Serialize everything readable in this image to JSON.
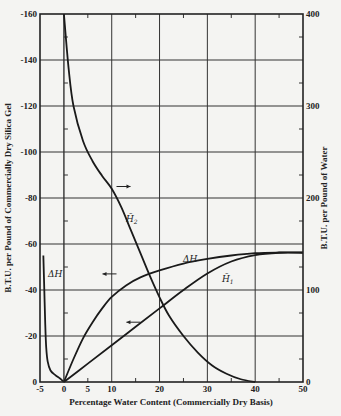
{
  "chart_data": {
    "type": "line",
    "title": "",
    "xlabel": "Percentage Water Content (Commercially Dry Basis)",
    "ylabel_left": "B.T.U. per Pound of Commercially Dry Silica Gel",
    "ylabel_right": "B.T.U. per Pound of Water",
    "xlim": [
      -5,
      50
    ],
    "ylim_left": [
      0,
      -160
    ],
    "ylim_right": [
      0,
      400
    ],
    "grid": true,
    "x_ticks": [
      "-5",
      "0",
      "5",
      "10",
      "20",
      "30",
      "40",
      "50"
    ],
    "y_left_ticks": [
      "0",
      "-20",
      "-40",
      "-60",
      "-80",
      "-100",
      "-120",
      "-140",
      "-160"
    ],
    "y_right_ticks": [
      "0",
      "100",
      "200",
      "300",
      "400"
    ],
    "series": [
      {
        "name": "H̄2",
        "axis": "right",
        "label": "H̄2",
        "points": [
          [
            0,
            400
          ],
          [
            1,
            340
          ],
          [
            2,
            300
          ],
          [
            4,
            262
          ],
          [
            6,
            240
          ],
          [
            8,
            224
          ],
          [
            10,
            210
          ],
          [
            12,
            190
          ],
          [
            14,
            165
          ],
          [
            16,
            140
          ],
          [
            18,
            115
          ],
          [
            20,
            92
          ],
          [
            22,
            72
          ],
          [
            25,
            50
          ],
          [
            28,
            32
          ],
          [
            31,
            18
          ],
          [
            34,
            9
          ],
          [
            37,
            3
          ],
          [
            40,
            0
          ]
        ]
      },
      {
        "name": "ΔH",
        "axis": "left",
        "label": "ΔH",
        "points": [
          [
            0,
            0
          ],
          [
            2,
            -10
          ],
          [
            4,
            -19
          ],
          [
            6,
            -26
          ],
          [
            8,
            -32
          ],
          [
            10,
            -37
          ],
          [
            13,
            -42
          ],
          [
            16,
            -45.5
          ],
          [
            20,
            -48.5
          ],
          [
            25,
            -51.5
          ],
          [
            30,
            -53.5
          ],
          [
            35,
            -55
          ],
          [
            40,
            -56
          ],
          [
            45,
            -56.3
          ],
          [
            50,
            -56.3
          ]
        ]
      },
      {
        "name": "ΔH (dehydration branch)",
        "axis": "left",
        "label": "ΔH",
        "points": [
          [
            -4.3,
            -55
          ],
          [
            -4.1,
            -40
          ],
          [
            -3.9,
            -25
          ],
          [
            -3.7,
            -15
          ],
          [
            -3.4,
            -9
          ],
          [
            -2.8,
            -5
          ],
          [
            -1.8,
            -3
          ],
          [
            -0.8,
            -1.5
          ],
          [
            0,
            0
          ]
        ]
      },
      {
        "name": "H̄1",
        "axis": "right",
        "label": "H̄1",
        "points": [
          [
            0,
            0
          ],
          [
            5,
            20
          ],
          [
            10,
            40
          ],
          [
            15,
            60
          ],
          [
            20,
            80
          ],
          [
            25,
            100
          ],
          [
            30,
            118
          ],
          [
            35,
            131
          ],
          [
            40,
            138
          ],
          [
            45,
            140.5
          ],
          [
            50,
            140.5
          ]
        ]
      }
    ],
    "annotations": [
      {
        "type": "arrow",
        "direction": "right",
        "near": "H̄2",
        "at": [
          11,
          -85
        ]
      },
      {
        "type": "arrow",
        "direction": "left",
        "near": "ΔH",
        "at": [
          11,
          -47
        ]
      },
      {
        "type": "arrow",
        "direction": "left",
        "near": "H̄1",
        "at": [
          16,
          -26
        ]
      }
    ]
  },
  "labels": {
    "xlabel": "Percentage Water Content (Commercially Dry Basis)",
    "ylabel_left": "B.T.U. per Pound of Commercially Dry Silica Gel",
    "ylabel_right": "B.T.U. per Pound of Water",
    "curve_h2": "H̄",
    "curve_h2_sub": "2",
    "curve_h1": "H̄",
    "curve_h1_sub": "1",
    "curve_dh": "ΔH",
    "curve_dh_left": "ΔH"
  }
}
